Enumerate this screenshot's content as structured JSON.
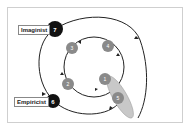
{
  "diagram": {
    "outer_labels": [
      {
        "id": "imaginist",
        "text": "Imaginist",
        "node_number": "7"
      },
      {
        "id": "empiricist",
        "text": "Empiricist",
        "node_number": "6"
      }
    ],
    "inner_nodes": [
      {
        "id": "n1",
        "number": "1"
      },
      {
        "id": "n2",
        "number": "2"
      },
      {
        "id": "n3",
        "number": "3"
      },
      {
        "id": "n4",
        "number": "4"
      },
      {
        "id": "n5",
        "number": "5"
      }
    ],
    "colors": {
      "outer_node": "#111111",
      "inner_node": "#8a8a8a",
      "ellipse": "#c8c8c8",
      "line": "#222222"
    }
  }
}
